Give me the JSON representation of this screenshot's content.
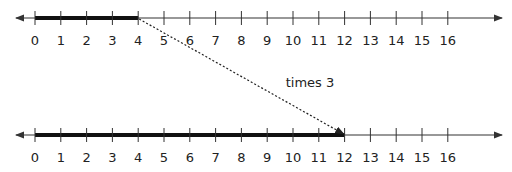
{
  "diagram": {
    "type": "number-line-multiplication",
    "annotation": "times 3",
    "number_lines": [
      {
        "name": "top",
        "min": 0,
        "max": 16,
        "tick_labels": [
          "0",
          "1",
          "2",
          "3",
          "4",
          "5",
          "6",
          "7",
          "8",
          "9",
          "10",
          "11",
          "12",
          "13",
          "14",
          "15",
          "16"
        ],
        "highlight": {
          "from": 0,
          "to": 4
        }
      },
      {
        "name": "bottom",
        "min": 0,
        "max": 16,
        "tick_labels": [
          "0",
          "1",
          "2",
          "3",
          "4",
          "5",
          "6",
          "7",
          "8",
          "9",
          "10",
          "11",
          "12",
          "13",
          "14",
          "15",
          "16"
        ],
        "highlight": {
          "from": 0,
          "to": 12
        }
      }
    ],
    "arrow": {
      "from_value": 4,
      "from_line": "top",
      "to_value": 12,
      "to_line": "bottom",
      "style": "dotted"
    },
    "colors": {
      "line": "#333333",
      "highlight": "#111111",
      "text": "#222222"
    }
  }
}
